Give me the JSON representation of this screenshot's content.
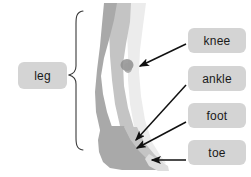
{
  "diagram": {
    "background_color": "#ffffff",
    "labels": {
      "leg": "leg",
      "knee": "knee",
      "ankle": "ankle",
      "foot": "foot",
      "toe": "toe"
    },
    "colors": {
      "label_box": "#d4d4d4",
      "label_text": "#1a1a1a",
      "leg_dark": "#a9a9a9",
      "leg_mid": "#c4c4c4",
      "leg_light": "#dedede",
      "leg_highlight": "#ececec",
      "knee_spot": "#8f8f8f",
      "arrow": "#111111",
      "brace": "#3a3a3a"
    },
    "parts": [
      {
        "name": "leg",
        "region": "whole limb",
        "pointer": "brace"
      },
      {
        "name": "knee",
        "region": "mid joint",
        "pointer": "arrow"
      },
      {
        "name": "ankle",
        "region": "lower joint",
        "pointer": "arrow"
      },
      {
        "name": "foot",
        "region": "base",
        "pointer": "arrow"
      },
      {
        "name": "toe",
        "region": "front tip of foot",
        "pointer": "arrow"
      }
    ]
  }
}
